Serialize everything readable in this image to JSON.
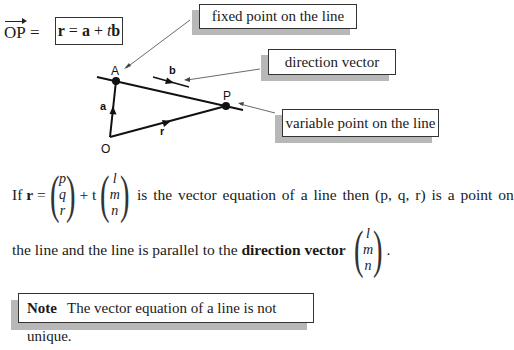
{
  "header": {
    "op_label": "OP",
    "equals": "=",
    "equation": {
      "r": "r",
      "eq": " = ",
      "a": "a",
      "plus": " + ",
      "t": "t",
      "b": "b"
    }
  },
  "diagram": {
    "points": [
      {
        "label": "A",
        "x": 116,
        "y": 81
      },
      {
        "label": "P",
        "x": 226,
        "y": 106
      },
      {
        "label": "O",
        "x": 110,
        "y": 141
      }
    ],
    "vector_labels": {
      "a": "a",
      "b": "b",
      "r": "r"
    },
    "callouts": {
      "fixed_point": "fixed point on the line",
      "direction_vector": "direction vector",
      "variable_point": "variable point on the line"
    }
  },
  "paragraph": {
    "line1_if": "If",
    "line1_r": "r",
    "line1_eq": "=",
    "vector1": [
      "p",
      "q",
      "r"
    ],
    "plus_t": "+ t",
    "vector2": [
      "l",
      "m",
      "n"
    ],
    "line1_rest": "is the vector equation of a line then (p, q, r) is a point on",
    "line2_start": "the line and the line is parallel to the",
    "line2_bold": "direction vector",
    "vector3": [
      "l",
      "m",
      "n"
    ],
    "line2_end": "."
  },
  "note": {
    "label": "Note",
    "text": "The vector equation of a line is not unique."
  }
}
